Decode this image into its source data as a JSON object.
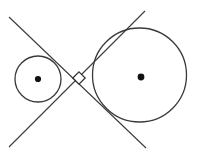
{
  "figure": {
    "canvas": {
      "width": 198,
      "height": 154,
      "background": "#ffffff"
    },
    "stroke_color": "#3a3a3a",
    "dot_color": "#111111",
    "circles": [
      {
        "name": "small-circle",
        "cx": 38,
        "cy": 79,
        "r": 23,
        "center_label": "",
        "stroke": "#3a3a3a",
        "stroke_width": 1.3
      },
      {
        "name": "large-circle",
        "cx": 139.5,
        "cy": 75,
        "r": 47,
        "center_label": "",
        "stroke": "#3a3a3a",
        "stroke_width": 1.3
      }
    ],
    "center_dots": [
      {
        "name": "small-circle-center",
        "cx": 38,
        "cy": 79,
        "r": 3.1
      },
      {
        "name": "large-circle-center",
        "cx": 141,
        "cy": 77,
        "r": 3.4
      }
    ],
    "intersection": {
      "x": 78,
      "y": 78
    },
    "tangent_lines": [
      {
        "name": "tangent-line-descending",
        "x1": 9,
        "y1": 17,
        "x2": 146,
        "y2": 148,
        "slope": 0.95
      },
      {
        "name": "tangent-line-ascending",
        "x1": 145,
        "y1": 11,
        "x2": 9,
        "y2": 147,
        "slope": -1.0
      }
    ],
    "right_angle_marker": {
      "name": "right-angle-marker",
      "cx": 79,
      "cy": 78,
      "half_diagonal": 6.2,
      "fill": "#ffffff",
      "stroke": "#2e2e2e"
    }
  }
}
